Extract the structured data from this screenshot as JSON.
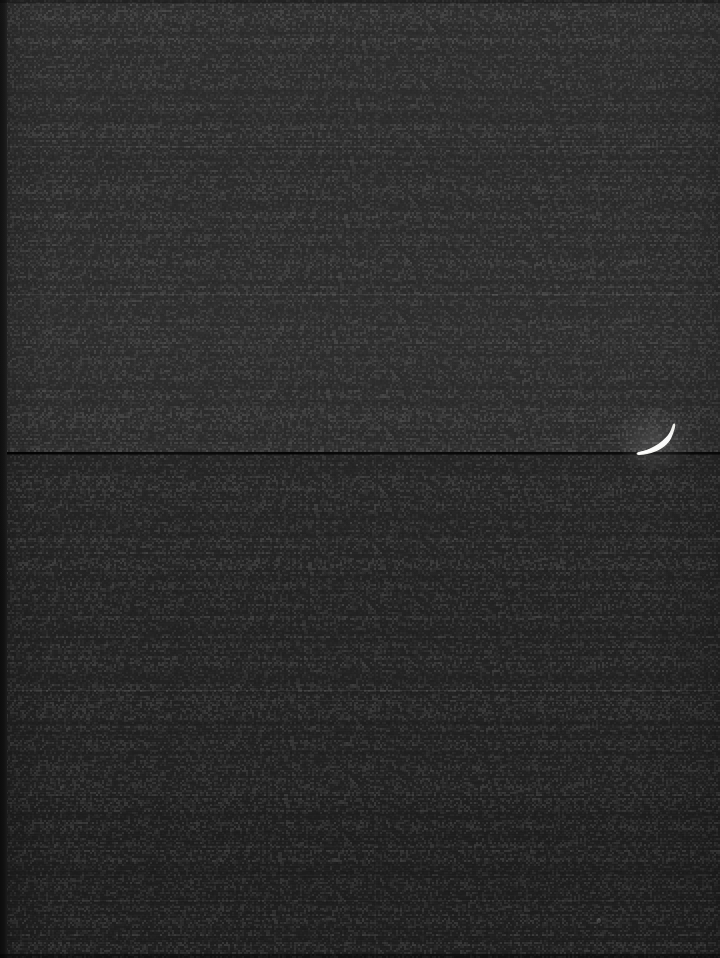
{
  "image": {
    "domain": "natural-image",
    "description": "Extremely dark, underexposed night photograph",
    "width": 720,
    "height": 958,
    "background_color": "#292929",
    "overall_appearance": "near-black flat field with faint horizontal banding"
  },
  "background": {
    "zones": [
      {
        "name": "top-zone",
        "top": 0,
        "height": 146,
        "color": "#2b2b2b"
      },
      {
        "name": "upper-zone",
        "top": 146,
        "height": 148,
        "color": "#2a2a2a"
      },
      {
        "name": "middle-zone",
        "top": 294,
        "height": 158,
        "color": "#2c2c2c"
      },
      {
        "name": "below-horizon-zone",
        "top": 453,
        "height": 84,
        "color": "#262626"
      },
      {
        "name": "lower-zone",
        "top": 537,
        "height": 150,
        "color": "#272727"
      },
      {
        "name": "low-striated-zone",
        "top": 687,
        "height": 105,
        "color": "#252525"
      },
      {
        "name": "bottom-zone",
        "top": 792,
        "height": 166,
        "color": "#232323"
      }
    ],
    "left_edge_strip": {
      "width": 7,
      "color": "#141414"
    }
  },
  "features": {
    "horizon_line": {
      "label": "thin dark horizontal line",
      "y": 452,
      "thickness": 2,
      "color": "#050505",
      "spans_full_width": true
    },
    "band_seams": [
      {
        "name": "seam-1",
        "y": 146,
        "tone": "light"
      },
      {
        "name": "seam-2",
        "y": 294,
        "tone": "light"
      },
      {
        "name": "seam-3",
        "y": 489,
        "tone": "dim"
      },
      {
        "name": "seam-4",
        "y": 541,
        "tone": "dim"
      },
      {
        "name": "seam-5",
        "y": 690,
        "tone": "light"
      },
      {
        "name": "seam-6",
        "y": 700,
        "tone": "dim"
      },
      {
        "name": "seam-7",
        "y": 792,
        "tone": "dim"
      },
      {
        "name": "seam-8",
        "y": 846,
        "tone": "dim"
      },
      {
        "name": "seam-9",
        "y": 900,
        "tone": "dim"
      }
    ],
    "vertical_seam": {
      "name": "vertical-seam",
      "x": 375
    },
    "crescent": {
      "label": "bright white crescent shape",
      "x": 636,
      "y": 422,
      "width": 42,
      "height": 32,
      "color": "#fdfdfb",
      "note": "curved hook / crescent, brightest element in frame"
    },
    "speck": {
      "label": "faint light speck",
      "x": 597,
      "y": 918
    }
  }
}
